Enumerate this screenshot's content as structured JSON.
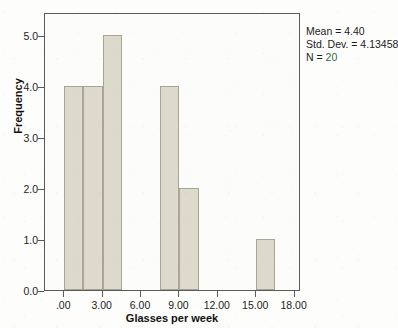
{
  "chart_data": {
    "type": "bar",
    "title": "",
    "subtitle": "",
    "xlabel": "Glasses per week",
    "ylabel": "Frequency",
    "xlim": [
      -1.5,
      18.5
    ],
    "ylim": [
      0,
      5.45
    ],
    "grid": false,
    "legend": null,
    "bin_width": 1.5,
    "x_ticks": [
      {
        "value": 0,
        "label": ".00"
      },
      {
        "value": 3,
        "label": "3.00"
      },
      {
        "value": 6,
        "label": "6.00"
      },
      {
        "value": 9,
        "label": "9.00"
      },
      {
        "value": 12,
        "label": "12.00"
      },
      {
        "value": 15,
        "label": "15.00"
      },
      {
        "value": 18,
        "label": "18.00"
      }
    ],
    "y_ticks": [
      {
        "value": 0,
        "label": "0.0"
      },
      {
        "value": 1,
        "label": "1.0"
      },
      {
        "value": 2,
        "label": "2.0"
      },
      {
        "value": 3,
        "label": "3.0"
      },
      {
        "value": 4,
        "label": "4.0"
      },
      {
        "value": 5,
        "label": "5.0"
      }
    ],
    "bars": [
      {
        "bin_start": 0.0,
        "bin_end": 1.5,
        "frequency": 4
      },
      {
        "bin_start": 1.5,
        "bin_end": 3.0,
        "frequency": 4
      },
      {
        "bin_start": 3.0,
        "bin_end": 4.5,
        "frequency": 5
      },
      {
        "bin_start": 7.5,
        "bin_end": 9.0,
        "frequency": 4
      },
      {
        "bin_start": 9.0,
        "bin_end": 10.5,
        "frequency": 2
      },
      {
        "bin_start": 15.0,
        "bin_end": 16.5,
        "frequency": 1
      }
    ],
    "annotations": {
      "mean_label": "Mean = 4.40",
      "std_dev_label": "Std. Dev. = 4.13458",
      "n_prefix": "N = ",
      "n_value": "20"
    },
    "colors": {
      "bar_fill": "#dedacb",
      "bar_border": "#a9a497",
      "axis": "#5a5a5a",
      "text": "#1c1c1c",
      "n_value": "#2f6b47",
      "plot_background": "#fcfcfb",
      "page_background": "#fdfdfc"
    }
  }
}
